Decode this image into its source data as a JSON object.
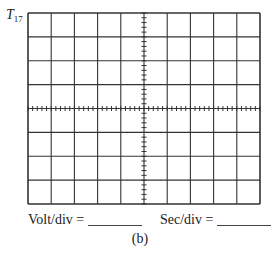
{
  "figure": {
    "label": "T",
    "label_subscript": "17",
    "caption": "(b)"
  },
  "grid": {
    "horizontal_divisions": 10,
    "vertical_divisions": 8,
    "minor_ticks_per_division": 5,
    "line_color": "#333333"
  },
  "fields": {
    "volt_div_label": "Volt/div =",
    "volt_div_value": "",
    "sec_div_label": "Sec/div =",
    "sec_div_value": ""
  }
}
